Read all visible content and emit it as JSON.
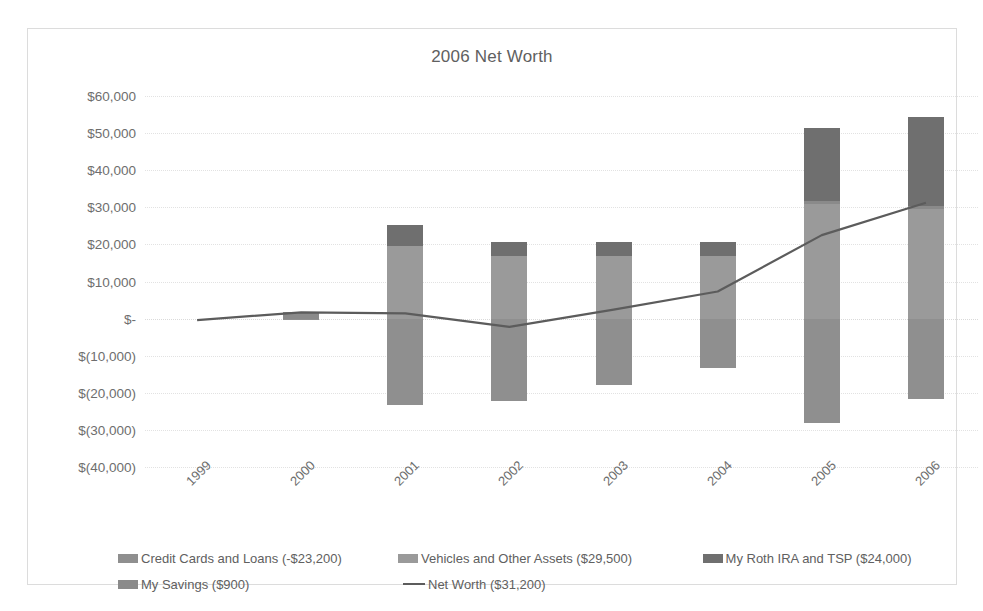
{
  "chart_data": {
    "type": "bar",
    "title": "2006 Net Worth",
    "xlabel": "",
    "ylabel": "",
    "grid": true,
    "legend_position": "bottom",
    "ylim": [
      -40000,
      60000
    ],
    "ytick_values": [
      60000,
      50000,
      40000,
      30000,
      20000,
      10000,
      0,
      -10000,
      -20000,
      -30000,
      -40000
    ],
    "ytick_labels": [
      "$60,000",
      "$50,000",
      "$40,000",
      "$30,000",
      "$20,000",
      "$10,000",
      "$-",
      "$(10,000)",
      "$(20,000)",
      "$(30,000)",
      "$(40,000)"
    ],
    "categories": [
      "1999",
      "2000",
      "2001",
      "2002",
      "2003",
      "2004",
      "2005",
      "2006"
    ],
    "stacked": true,
    "series": [
      {
        "name": "Credit Cards and Loans (-$23,200)",
        "label": "Credit Cards and Loans (-$23,200)",
        "color": "#8f8f8f",
        "kind": "bar",
        "values": [
          0,
          -500,
          -23200,
          -22300,
          -17800,
          -13200,
          -28200,
          -21800
        ]
      },
      {
        "name": "Vehicles and Other Assets ($29,500)",
        "label": "Vehicles and Other Assets ($29,500)",
        "color": "#9a9a9a",
        "kind": "bar",
        "values": [
          0,
          0,
          19500,
          17000,
          17000,
          17000,
          31000,
          29500
        ]
      },
      {
        "name": "My Roth IRA and TSP ($24,000)",
        "label": "My Roth IRA and TSP ($24,000)",
        "color": "#6f6f6f",
        "kind": "bar",
        "values": [
          0,
          0,
          5700,
          3700,
          3700,
          3700,
          19800,
          23900
        ]
      },
      {
        "name": "My Savings ($900)",
        "label": "My Savings ($900)",
        "color": "#8a8a8a",
        "kind": "bar",
        "values": [
          0,
          1700,
          0,
          0,
          0,
          0,
          700,
          900
        ]
      },
      {
        "name": "Net Worth ($31,200)",
        "label": "Net Worth ($31,200)",
        "color": "#5c5c5c",
        "kind": "line",
        "values": [
          -400,
          1700,
          1400,
          -2200,
          2400,
          7300,
          22500,
          31200
        ]
      }
    ]
  },
  "legend": {
    "rows": [
      [
        "Credit Cards and Loans (-$23,200)",
        "Vehicles and Other Assets ($29,500)",
        "My Roth IRA and TSP ($24,000)"
      ],
      [
        "My Savings ($900)",
        "Net Worth ($31,200)"
      ]
    ]
  }
}
